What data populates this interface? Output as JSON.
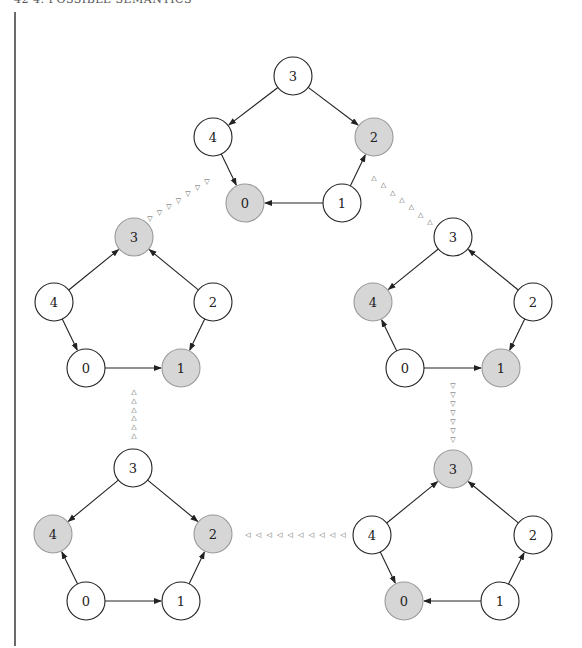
{
  "header": {
    "text": "42    4. POSSIBLE SEMANTICS"
  },
  "style": {
    "shaded_fill": "#d6d6d6",
    "shaded_stroke": "#9a9a9a",
    "edge_color": "#222222",
    "node_radius": 19
  },
  "graphs": [
    {
      "id": "top",
      "nodes": [
        {
          "label": "3",
          "x": 293,
          "y": 76,
          "shaded": false
        },
        {
          "label": "4",
          "x": 213,
          "y": 137,
          "shaded": false
        },
        {
          "label": "2",
          "x": 374,
          "y": 137,
          "shaded": true
        },
        {
          "label": "0",
          "x": 245,
          "y": 203,
          "shaded": true
        },
        {
          "label": "1",
          "x": 342,
          "y": 203,
          "shaded": false
        }
      ],
      "edges": [
        [
          "3",
          "4"
        ],
        [
          "3",
          "2"
        ],
        [
          "4",
          "0"
        ],
        [
          "1",
          "0"
        ],
        [
          "1",
          "2"
        ]
      ]
    },
    {
      "id": "middle-left",
      "nodes": [
        {
          "label": "3",
          "x": 134,
          "y": 237,
          "shaded": true
        },
        {
          "label": "4",
          "x": 54,
          "y": 302,
          "shaded": false
        },
        {
          "label": "2",
          "x": 213,
          "y": 302,
          "shaded": false
        },
        {
          "label": "0",
          "x": 86,
          "y": 368,
          "shaded": false
        },
        {
          "label": "1",
          "x": 181,
          "y": 368,
          "shaded": true
        }
      ],
      "edges": [
        [
          "4",
          "3"
        ],
        [
          "2",
          "3"
        ],
        [
          "4",
          "0"
        ],
        [
          "2",
          "1"
        ],
        [
          "0",
          "1"
        ]
      ]
    },
    {
      "id": "middle-right",
      "nodes": [
        {
          "label": "3",
          "x": 453,
          "y": 237,
          "shaded": false
        },
        {
          "label": "4",
          "x": 373,
          "y": 302,
          "shaded": true
        },
        {
          "label": "2",
          "x": 533,
          "y": 302,
          "shaded": false
        },
        {
          "label": "0",
          "x": 405,
          "y": 368,
          "shaded": false
        },
        {
          "label": "1",
          "x": 501,
          "y": 368,
          "shaded": true
        }
      ],
      "edges": [
        [
          "3",
          "4"
        ],
        [
          "2",
          "3"
        ],
        [
          "0",
          "4"
        ],
        [
          "2",
          "1"
        ],
        [
          "0",
          "1"
        ]
      ]
    },
    {
      "id": "bottom-left",
      "nodes": [
        {
          "label": "3",
          "x": 133,
          "y": 468,
          "shaded": false
        },
        {
          "label": "4",
          "x": 53,
          "y": 534,
          "shaded": true
        },
        {
          "label": "2",
          "x": 213,
          "y": 534,
          "shaded": true
        },
        {
          "label": "0",
          "x": 86,
          "y": 601,
          "shaded": false
        },
        {
          "label": "1",
          "x": 181,
          "y": 601,
          "shaded": false
        }
      ],
      "edges": [
        [
          "3",
          "4"
        ],
        [
          "3",
          "2"
        ],
        [
          "0",
          "4"
        ],
        [
          "0",
          "1"
        ],
        [
          "1",
          "2"
        ]
      ]
    },
    {
      "id": "bottom-right",
      "nodes": [
        {
          "label": "3",
          "x": 453,
          "y": 469,
          "shaded": true
        },
        {
          "label": "4",
          "x": 372,
          "y": 535,
          "shaded": false
        },
        {
          "label": "2",
          "x": 533,
          "y": 535,
          "shaded": false
        },
        {
          "label": "0",
          "x": 404,
          "y": 601,
          "shaded": true
        },
        {
          "label": "1",
          "x": 500,
          "y": 601,
          "shaded": false
        }
      ],
      "edges": [
        [
          "4",
          "3"
        ],
        [
          "2",
          "3"
        ],
        [
          "4",
          "0"
        ],
        [
          "1",
          "0"
        ],
        [
          "1",
          "2"
        ]
      ]
    }
  ],
  "connectors": [
    {
      "from": "top",
      "to": "middle-left",
      "glyph": "▽",
      "x1": 207,
      "y1": 182,
      "x2": 150,
      "y2": 219,
      "count": 7
    },
    {
      "from": "middle-right",
      "to": "top",
      "glyph": "△",
      "x1": 374,
      "y1": 178,
      "x2": 430,
      "y2": 222,
      "count": 7
    },
    {
      "from": "bottom-left",
      "to": "middle-left",
      "glyph": "△",
      "x1": 134,
      "y1": 392,
      "x2": 134,
      "y2": 436,
      "count": 6
    },
    {
      "from": "middle-right",
      "to": "bottom-right",
      "glyph": "▽",
      "x1": 453,
      "y1": 386,
      "x2": 453,
      "y2": 440,
      "count": 7
    },
    {
      "from": "bottom-right",
      "to": "bottom-left",
      "glyph": "◁",
      "x1": 248,
      "y1": 535,
      "x2": 343,
      "y2": 535,
      "count": 10
    }
  ]
}
